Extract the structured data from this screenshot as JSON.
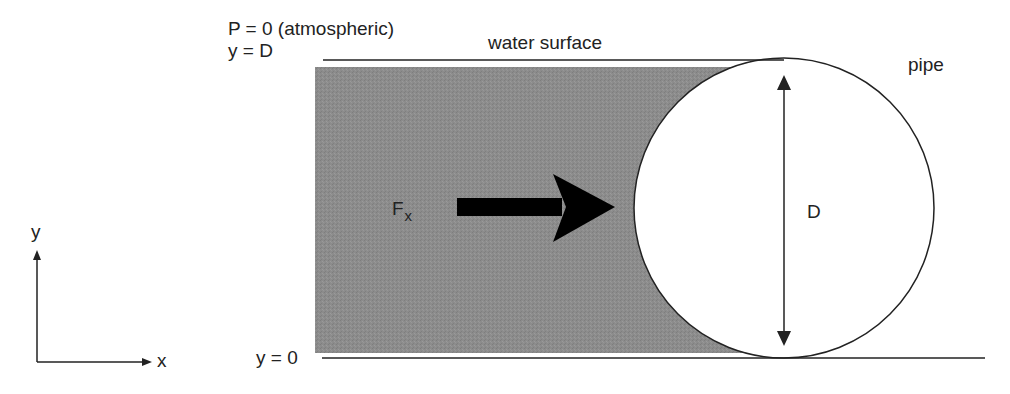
{
  "labels": {
    "pressure": "P = 0 (atmospheric)",
    "y_top": "y = D",
    "water_surface": "water surface",
    "pipe": "pipe",
    "force_main": "F",
    "force_sub": "x",
    "diameter": "D",
    "y_bottom": "y = 0",
    "axis_x": "x",
    "axis_y": "y"
  },
  "colors": {
    "water_fill": "#8a8a8a",
    "line": "#222222",
    "arrow": "#000000",
    "pipe_fill": "#ffffff"
  },
  "geometry": {
    "pipe_center": [
      784,
      208
    ],
    "pipe_radius": 150
  }
}
